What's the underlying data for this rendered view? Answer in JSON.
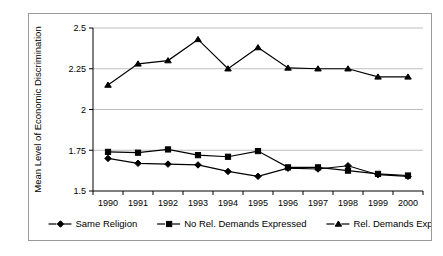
{
  "chart_data": {
    "type": "line",
    "title": "",
    "xlabel": "",
    "ylabel": "Mean Level of Economic Discrimination",
    "categories": [
      "1990",
      "1991",
      "1992",
      "1993",
      "1994",
      "1995",
      "1996",
      "1997",
      "1998",
      "1999",
      "2000"
    ],
    "ylim": [
      1.5,
      2.5
    ],
    "yticks": [
      1.5,
      1.75,
      2,
      2.25,
      2.5
    ],
    "ytick_labels": [
      "1.5",
      "1.75",
      "2",
      "2.25",
      "2.5"
    ],
    "grid": "horizontal",
    "legend_position": "bottom",
    "series": [
      {
        "name": "Same Religion",
        "marker": "diamond",
        "values": [
          1.7,
          1.67,
          1.665,
          1.66,
          1.62,
          1.59,
          1.64,
          1.635,
          1.655,
          1.6,
          1.59
        ]
      },
      {
        "name": "No Rel. Demands Expressed",
        "marker": "square",
        "values": [
          1.74,
          1.735,
          1.755,
          1.72,
          1.71,
          1.745,
          1.645,
          1.645,
          1.625,
          1.605,
          1.595
        ]
      },
      {
        "name": "Rel. Demands Expressed",
        "marker": "triangle",
        "values": [
          2.15,
          2.28,
          2.3,
          2.43,
          2.25,
          2.38,
          2.255,
          2.25,
          2.25,
          2.2,
          2.2
        ]
      }
    ]
  },
  "legend": {
    "entries": [
      {
        "label": "Same Religion",
        "marker": "diamond"
      },
      {
        "label": "No Rel. Demands Expressed",
        "marker": "square"
      },
      {
        "label": "Rel. Demands Expressed",
        "marker": "triangle"
      }
    ]
  },
  "colors": {
    "line": "#000000",
    "grid": "#bfbfbf",
    "frame": "#9a9a9a",
    "background": "#ffffff"
  }
}
